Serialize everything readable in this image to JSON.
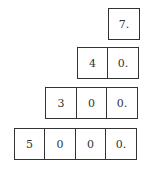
{
  "diagram": {
    "rows": [
      {
        "cells": [
          "7."
        ]
      },
      {
        "cells": [
          "4",
          "0."
        ]
      },
      {
        "cells": [
          "3",
          "0",
          "0."
        ]
      },
      {
        "cells": [
          "5",
          "0",
          "0",
          "0."
        ]
      }
    ]
  }
}
